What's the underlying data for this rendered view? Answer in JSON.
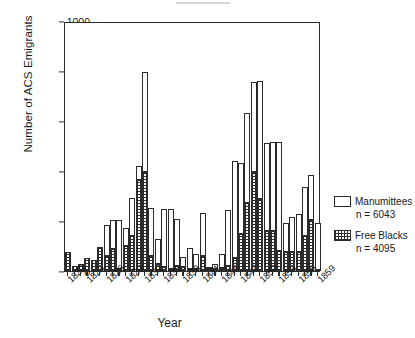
{
  "chart_data": {
    "type": "bar",
    "title": "",
    "xlabel": "Year",
    "ylabel": "Number of ACS Emigrants",
    "ylim": [
      0,
      1000
    ],
    "yticks": [
      0,
      200,
      400,
      600,
      800,
      1000
    ],
    "ytick_labels": [
      "0",
      "200",
      "400",
      "600",
      "800",
      "1000"
    ],
    "grid": false,
    "stacked": true,
    "legend_position": "right",
    "categories": [
      "1820",
      "1821",
      "1822",
      "1823",
      "1824",
      "1825",
      "1826",
      "1827",
      "1828",
      "1829",
      "1830",
      "1831",
      "1832",
      "1833",
      "1834",
      "1835",
      "1836",
      "1837",
      "1838",
      "1839",
      "1840",
      "1841",
      "1842",
      "1843",
      "1844",
      "1845",
      "1846",
      "1847",
      "1848",
      "1849",
      "1850",
      "1851",
      "1852",
      "1853",
      "1854",
      "1855",
      "1856",
      "1857",
      "1858",
      "1859"
    ],
    "xtick_labels": [
      "1820",
      "1823",
      "1826",
      "1829",
      "1832",
      "1835",
      "1838",
      "1841",
      "1844",
      "1847",
      "1850",
      "1853",
      "1856",
      "1859"
    ],
    "series": [
      {
        "name": "Free Blacks",
        "fill": "checkered-hatch",
        "n": 4095,
        "values": [
          78,
          22,
          28,
          52,
          45,
          98,
          62,
          88,
          10,
          100,
          140,
          365,
          395,
          62,
          30,
          18,
          8,
          22,
          16,
          10,
          8,
          62,
          8,
          10,
          12,
          22,
          52,
          148,
          272,
          398,
          290,
          162,
          160,
          82,
          76,
          78,
          76,
          142,
          206,
          6
        ]
      },
      {
        "name": "Manumittees",
        "fill": "open-white",
        "n": 6043,
        "values": [
          0,
          0,
          0,
          0,
          0,
          0,
          122,
          118,
          196,
          72,
          152,
          55,
          400,
          190,
          98,
          232,
          242,
          188,
          42,
          84,
          62,
          172,
          6,
          20,
          58,
          222,
          388,
          285,
          362,
          358,
          470,
          352,
          356,
          436,
          116,
          138,
          152,
          196,
          180,
          186
        ]
      }
    ],
    "totals": [
      78,
      22,
      28,
      52,
      45,
      98,
      184,
      206,
      206,
      172,
      292,
      420,
      795,
      252,
      128,
      250,
      250,
      210,
      58,
      94,
      70,
      234,
      14,
      30,
      70,
      244,
      440,
      433,
      634,
      756,
      760,
      514,
      516,
      518,
      192,
      216,
      228,
      338,
      386,
      192
    ]
  },
  "legend": {
    "entries": [
      {
        "label": "Manumittees",
        "count_text": "n = 6043",
        "swatch": "open-white"
      },
      {
        "label": "Free Blacks",
        "count_text": "n = 4095",
        "swatch": "checkered-hatch"
      }
    ]
  },
  "colors": {
    "ink": "#2b2b2b",
    "background": "#ffffff"
  }
}
